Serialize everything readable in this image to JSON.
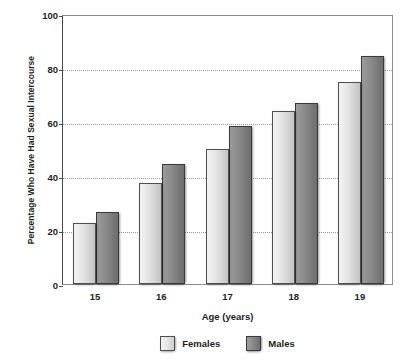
{
  "chart_data": {
    "type": "bar",
    "title": "",
    "subtitle": "",
    "xlabel": "Age (years)",
    "ylabel": "Percentage Who Have Had Sexual Intercourse",
    "categories": [
      "15",
      "16",
      "17",
      "18",
      "19"
    ],
    "series": [
      {
        "name": "Females",
        "values": [
          22.5,
          37.5,
          50,
          64,
          75
        ],
        "color": "#e2e2e2"
      },
      {
        "name": "Males",
        "values": [
          26.5,
          44.5,
          58.5,
          67,
          84.5
        ],
        "color": "#8a8a8a"
      }
    ],
    "ylim": [
      0,
      100
    ],
    "yticks": [
      0,
      20,
      40,
      60,
      80,
      100
    ],
    "ytick_labels": [
      "0",
      "20",
      "40",
      "60",
      "80",
      "100"
    ],
    "grid": true,
    "grid_style": "dotted",
    "legend_position": "bottom",
    "legend_entries": [
      "Females",
      "Males"
    ],
    "axis_color": "#4a4a4a",
    "grid_color": "#9a9a9a",
    "text_color": "#231f20"
  }
}
